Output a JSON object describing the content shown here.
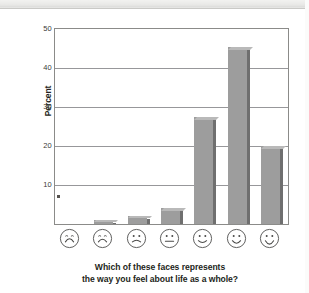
{
  "chart_data": {
    "type": "bar",
    "title": "",
    "subtitle": "",
    "xlabel_lines": [
      "Which of these faces represents",
      "the way you feel about life as a whole?"
    ],
    "ylabel": "Percent",
    "categories": [
      "face-1-very-unhappy",
      "face-2-unhappy",
      "face-3-slightly-unhappy",
      "face-4-neutral",
      "face-5-slightly-happy",
      "face-6-happy",
      "face-7-very-happy"
    ],
    "category_labels": [
      "frowning face (most unhappy)",
      "frowning face",
      "slight frown face",
      "neutral face",
      "slight smile face",
      "smiling face",
      "broadly smiling face (most happy)"
    ],
    "values": [
      0,
      1,
      2,
      4,
      27.5,
      45.5,
      20
    ],
    "value_labels": [
      "0",
      "1",
      "2",
      "4",
      "27.5",
      "45.5",
      "20"
    ],
    "ylim": [
      0,
      50
    ],
    "yticks": [
      10,
      20,
      30,
      40,
      50
    ],
    "ytick_labels": [
      "10",
      "20",
      "30",
      "40",
      "50"
    ],
    "grid": "horizontal",
    "legend": "none",
    "bar_color": "#9d9d9d",
    "bar_edge_color": "#6f6f6f",
    "gridline_color": "#97979a",
    "axis_color": "#8b8b89",
    "text_color": "#231f20",
    "annotations": [
      {
        "name": "zero-dot-marker",
        "category": "face-1-very-unhappy",
        "value": 6,
        "note": "small dot marker on axis"
      }
    ]
  },
  "axis": {
    "y_label": "Percent",
    "ticks": [
      "50",
      "40",
      "30",
      "20",
      "10"
    ]
  },
  "caption": {
    "line1": "Which of these faces represents",
    "line2": "the way you feel about life as a whole?"
  }
}
